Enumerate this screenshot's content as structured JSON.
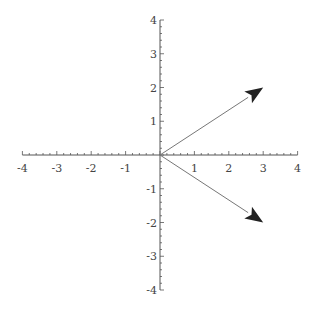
{
  "chart_data": {
    "type": "vector-plot",
    "title": "",
    "xlabel": "",
    "ylabel": "",
    "xlim": [
      -4,
      4
    ],
    "ylim": [
      -4,
      4
    ],
    "grid": false,
    "x_ticks": [
      -4,
      -3,
      -2,
      -1,
      1,
      2,
      3,
      4
    ],
    "y_ticks": [
      -4,
      -3,
      -2,
      -1,
      1,
      2,
      3,
      4
    ],
    "x_tick_labels": [
      "-4",
      "-3",
      "-2",
      "-1",
      "1",
      "2",
      "3",
      "4"
    ],
    "y_tick_labels": [
      "-4",
      "-3",
      "-2",
      "-1",
      "1",
      "2",
      "3",
      "4"
    ],
    "series": [
      {
        "name": "vector 1",
        "from": [
          0,
          0
        ],
        "to": [
          3,
          2
        ]
      },
      {
        "name": "vector 2",
        "from": [
          0,
          0
        ],
        "to": [
          3,
          -2
        ]
      }
    ]
  },
  "colors": {
    "axis": "#555555",
    "vector_line": "#777777",
    "arrowhead": "#222222",
    "label": "#444444"
  }
}
